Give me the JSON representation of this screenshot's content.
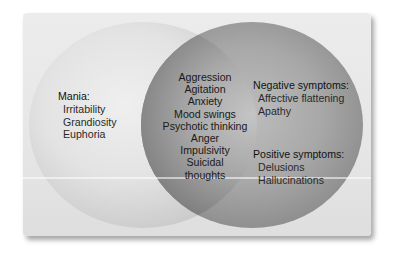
{
  "diagram": {
    "type": "venn",
    "colors": {
      "background": "#ffffff",
      "panel": "#e8e8e8",
      "left_circle": "#dcdcdc",
      "right_circle": "#9a9a9a",
      "overlap": "#8c8c8c",
      "text": "#1c1c1c"
    },
    "left": {
      "heading": "Mania:",
      "items": [
        "Irritability",
        "Grandiosity",
        "Euphoria"
      ]
    },
    "overlap": {
      "items": [
        "Aggression",
        "Agitation",
        "Anxiety",
        "Mood swings",
        "Psychotic thinking",
        "Anger",
        "Impulsivity",
        "Suicidal",
        "thoughts"
      ]
    },
    "right": {
      "groups": [
        {
          "heading": "Negative symptoms:",
          "items": [
            "Affective flattening",
            "Apathy"
          ]
        },
        {
          "heading": "Positive symptoms:",
          "items": [
            "Delusions",
            "Hallucinations"
          ]
        }
      ]
    }
  }
}
